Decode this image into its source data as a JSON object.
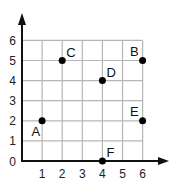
{
  "chart_data": {
    "type": "scatter",
    "title": "",
    "xlabel": "",
    "ylabel": "",
    "xlim": [
      0,
      6
    ],
    "ylim": [
      0,
      6
    ],
    "grid": true,
    "x_ticks": [
      "1",
      "2",
      "3",
      "4",
      "5",
      "6"
    ],
    "y_ticks": [
      "0",
      "1",
      "2",
      "3",
      "4",
      "5",
      "6"
    ],
    "points": [
      {
        "label": "A",
        "x": 1,
        "y": 2,
        "label_pos": "bottom-left"
      },
      {
        "label": "B",
        "x": 6,
        "y": 5,
        "label_pos": "top-left"
      },
      {
        "label": "C",
        "x": 2,
        "y": 5,
        "label_pos": "top-right"
      },
      {
        "label": "D",
        "x": 4,
        "y": 4,
        "label_pos": "top-right"
      },
      {
        "label": "E",
        "x": 6,
        "y": 2,
        "label_pos": "top-left"
      },
      {
        "label": "F",
        "x": 4,
        "y": 0,
        "label_pos": "top-right"
      }
    ],
    "colors": {
      "grid": "#b5b5b5",
      "axis": "#111111",
      "point": "#000000"
    }
  }
}
